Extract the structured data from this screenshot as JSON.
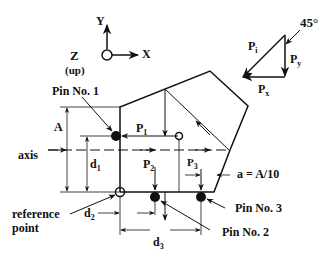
{
  "coordinate_system": {
    "y_label": "Y",
    "x_label": "X",
    "z_label": "Z",
    "z_note": "(up)"
  },
  "force_triangle": {
    "angle_label": "45°",
    "pi_label": "P",
    "pi_sub": "i",
    "py_label": "P",
    "py_sub": "y",
    "px_label": "P",
    "px_sub": "x"
  },
  "part": {
    "pins": [
      {
        "label": "Pin No. 1"
      },
      {
        "label": "Pin No. 2"
      },
      {
        "label": "Pin No. 3"
      }
    ],
    "forces": [
      {
        "label": "P",
        "sub": "1"
      },
      {
        "label": "P",
        "sub": "2"
      },
      {
        "label": "P",
        "sub": "3"
      }
    ],
    "axis_label": "axis",
    "reference_point_label_line1": "reference",
    "reference_point_label_line2": "point"
  },
  "dimensions": {
    "A": "A",
    "d1": "d",
    "d1_sub": "1",
    "d2": "d",
    "d2_sub": "2",
    "d3": "d",
    "d3_sub": "3",
    "a_note": "a = A/10"
  },
  "colors": {
    "ink": "#111111",
    "background": "#ffffff"
  }
}
